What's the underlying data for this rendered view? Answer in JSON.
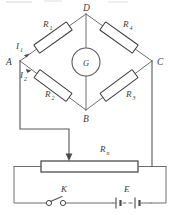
{
  "figure": {
    "kind": "wheatstone-bridge-circuit-diagram",
    "background_color": "#ffffff",
    "line_color": "#5a5a5c",
    "label_color": "#3a3a3c"
  },
  "nodes": [
    {
      "id": "D",
      "label": "D",
      "x": 86,
      "y": 14,
      "text_x": 83,
      "text_y": 11
    },
    {
      "id": "A",
      "label": "A",
      "x": 20,
      "y": 61,
      "text_x": 8,
      "text_y": 64
    },
    {
      "id": "C",
      "label": "C",
      "x": 152,
      "y": 61,
      "text_x": 157,
      "text_y": 64
    },
    {
      "id": "B",
      "label": "B",
      "x": 86,
      "y": 110,
      "text_x": 83,
      "text_y": 122
    }
  ],
  "resistors": [
    {
      "id": "R1",
      "label": "R",
      "sub": "1",
      "arm": "top-left",
      "label_x": 43,
      "label_y": 27,
      "sub_x": 50,
      "sub_y": 30
    },
    {
      "id": "R4",
      "label": "R",
      "sub": "4",
      "arm": "top-right",
      "label_x": 123,
      "label_y": 27,
      "sub_x": 130,
      "sub_y": 30
    },
    {
      "id": "R2",
      "label": "R",
      "sub": "2",
      "arm": "bottom-left",
      "label_x": 45,
      "label_y": 97,
      "sub_x": 52,
      "sub_y": 100
    },
    {
      "id": "R3",
      "label": "R",
      "sub": "3",
      "arm": "bottom-right",
      "label_x": 126,
      "label_y": 97,
      "sub_x": 133,
      "sub_y": 100
    }
  ],
  "currents": [
    {
      "id": "I1",
      "label": "I",
      "sub": "1",
      "label_x": 17,
      "label_y": 49,
      "sub_x": 22,
      "sub_y": 52
    },
    {
      "id": "I2",
      "label": "I",
      "sub": "2",
      "label_x": 21,
      "label_y": 77,
      "sub_x": 26,
      "sub_y": 80
    }
  ],
  "galvanometer": {
    "label": "G",
    "cx": 86,
    "cy": 62,
    "r": 14
  },
  "rheostat": {
    "label": "R",
    "sub": "n",
    "label_x": 100,
    "label_y": 150,
    "sub_x": 107,
    "sub_y": 153
  },
  "switch": {
    "label": "K",
    "label_x": 62,
    "label_y": 191
  },
  "battery": {
    "label": "E",
    "label_x": 124,
    "label_y": 191
  }
}
